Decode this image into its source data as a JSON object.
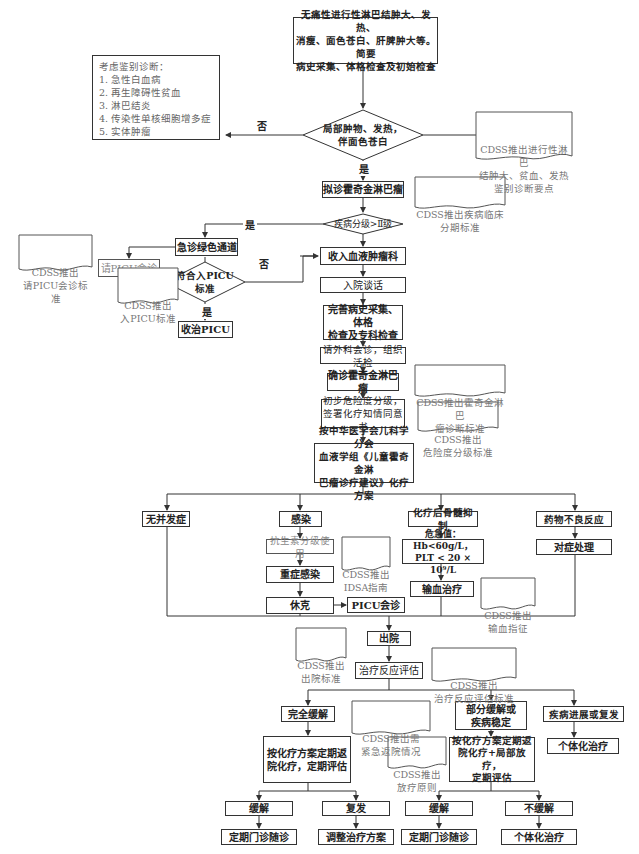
{
  "flowchart": {
    "start": "无痛性进行性淋巴结肿大、发热、\n消瘦、面色苍白、肝脾肿大等。简要\n病史采集、体格检查及初始检查",
    "differential": "考虑鉴别诊断：\n1. 急性白血病\n2. 再生障碍性贫血\n3. 淋巴结炎\n4. 传染性单核细胞增多症\n5. 实体肿瘤",
    "decision_local_mass": "局部肿物、发热，\n伴面色苍白",
    "cdss_diff": "CDSS推出进行性淋巴\n结肿大、贫血、发热\n鉴别诊断要点",
    "label_no_1": "否",
    "label_yes_1": "是",
    "suspect_hl": "拟诊霍奇金淋巴瘤",
    "cdss_staging": "CDSS推出疾病临床\n分期标准",
    "decision_grade": "疾病分级>Ⅱ级",
    "label_yes_2": "是",
    "emergency_channel": "急诊绿色通道",
    "picu_consult_request": "请PICU会诊",
    "cdss_picu_consult": "CDSS推出\n请PICU会诊标准",
    "decision_picu": "符合入PICU\n标准",
    "label_no_picu": "否",
    "label_yes_picu": "是",
    "cdss_picu_admit": "CDSS推出\n入PICU标准",
    "admit_picu": "收治PICU",
    "admit_hematology": "收入血液肿瘤科",
    "admission_talk": "入院谈话",
    "full_exam": "完善病史采集、体格\n检查及专科检查",
    "surgery_consult": "请外科会诊，组织活检",
    "confirm_hl": "确诊霍奇金淋巴瘤",
    "cdss_diagnosis": "CDSS推出霍奇金淋巴\n瘤诊断标准",
    "risk_grading": "初步危险度分级，\n签署化疗知情同意书",
    "cdss_risk": "CDSS推出\n危险度分级标准",
    "protocol": "按中华医学会儿科学分会\n血液学组《儿童霍奇金淋\n巴瘤诊疗建议》化疗方案",
    "no_complication": "无并发症",
    "infection": "感染",
    "antibiotics": "抗生素分级使用",
    "cdss_idsa": "CDSS推出\nIDSA指南",
    "severe_infection": "重症感染",
    "shock": "休克",
    "picu_consult": "PICU会诊",
    "myelosuppression": "化疗后骨髓抑制",
    "critical_values": "危急值：Hb<60g/L，\nPLT < 20 × 10⁹/L",
    "transfusion": "输血治疗",
    "cdss_transfusion": "CDSS推出\n输血指征",
    "adverse_reaction": "药物不良反应",
    "symptomatic": "对症处理",
    "cdss_discharge": "CDSS推出\n出院标准",
    "discharge": "出院",
    "response_eval": "治疗反应评估",
    "cdss_response": "CDSS推出\n治疗反应评估标准",
    "complete_remission": "完全缓解",
    "cdss_emergency_return": "CDSS推出需\n紧急返院情况",
    "partial_remission": "部分缓解或\n疾病稳定",
    "progression": "疾病进展或复发",
    "individualized_1": "个体化治疗",
    "cr_plan": "按化疗方案定期返\n院化疗，定期评估",
    "cdss_radiotherapy": "CDSS推出\n放疗原则",
    "pr_plan": "按化疗方案定期返\n院化疗+局部放疗，\n定期评估",
    "remission_1": "缓解",
    "relapse": "复发",
    "remission_2": "缓解",
    "no_remission": "不缓解",
    "followup_1": "定期门诊随诊",
    "adjust_plan": "调整治疗方案",
    "followup_2": "定期门诊随诊",
    "individualized_2": "个体化治疗"
  }
}
